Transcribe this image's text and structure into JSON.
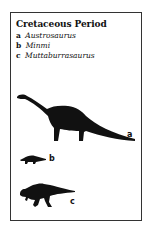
{
  "title": "Cretaceous Period",
  "legend": [
    {
      "key": "a",
      "name": "Austrosaurus"
    },
    {
      "key": "b",
      "name": "Minmi"
    },
    {
      "key": "c",
      "name": "Muttaburrasaurus"
    }
  ],
  "figures": [
    {
      "label": "a",
      "icon": "sauropod-silhouette-icon"
    },
    {
      "label": "b",
      "icon": "ankylosaur-silhouette-icon"
    },
    {
      "label": "c",
      "icon": "ornithopod-silhouette-icon"
    }
  ],
  "colors": {
    "ink": "#111111",
    "background": "#ffffff",
    "border": "#333333"
  }
}
